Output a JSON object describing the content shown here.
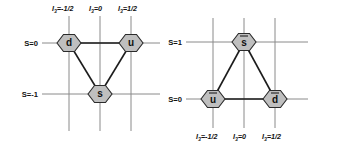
{
  "figure": {
    "title": "",
    "type": "weight-diagram",
    "panels": [
      {
        "id": "baryon-octet-left",
        "name": "quark-triplet",
        "vertical_axis": {
          "label_position": "top",
          "ticks": [
            {
              "text_prefix": "I",
              "text_sub": "3",
              "text_value": "=-1/2"
            },
            {
              "text_prefix": "I",
              "text_sub": "3",
              "text_value": "=0"
            },
            {
              "text_prefix": "I",
              "text_sub": "3",
              "text_value": "=1/2"
            }
          ]
        },
        "horizontal_axis": {
          "ticks": [
            {
              "label": "S=0"
            },
            {
              "label": "S=-1"
            }
          ]
        },
        "nodes": [
          {
            "name": "node-d",
            "label": "d",
            "bar": false,
            "i3": -0.5,
            "s": 0
          },
          {
            "name": "node-u",
            "label": "u",
            "bar": false,
            "i3": 0.5,
            "s": 0
          },
          {
            "name": "node-s",
            "label": "s",
            "bar": false,
            "i3": 0,
            "s": -1
          }
        ],
        "bonds": [
          [
            "node-d",
            "node-u"
          ],
          [
            "node-u",
            "node-s"
          ],
          [
            "node-s",
            "node-d"
          ]
        ]
      },
      {
        "id": "baryon-octet-right",
        "name": "antiquark-triplet",
        "vertical_axis": {
          "label_position": "bottom",
          "ticks": [
            {
              "text_prefix": "I",
              "text_sub": "3",
              "text_value": "=-1/2"
            },
            {
              "text_prefix": "I",
              "text_sub": "3",
              "text_value": "=0"
            },
            {
              "text_prefix": "I",
              "text_sub": "3",
              "text_value": "=1/2"
            }
          ]
        },
        "horizontal_axis": {
          "ticks": [
            {
              "label": "S=1"
            },
            {
              "label": "S=0"
            }
          ]
        },
        "nodes": [
          {
            "name": "node-sbar",
            "label": "s",
            "bar": true,
            "i3": 0,
            "s": 1
          },
          {
            "name": "node-ubar",
            "label": "u",
            "bar": true,
            "i3": -0.5,
            "s": 0
          },
          {
            "name": "node-dbar",
            "label": "d",
            "bar": true,
            "i3": 0.5,
            "s": 0
          }
        ],
        "bonds": [
          [
            "node-ubar",
            "node-dbar"
          ],
          [
            "node-sbar",
            "node-ubar"
          ],
          [
            "node-sbar",
            "node-dbar"
          ]
        ]
      }
    ],
    "colors": {
      "hex_fill": "#bfbfbf",
      "hex_stroke": "#2b2b2b",
      "grid": "#8a8a8a",
      "bond": "#1c1c1c",
      "background": "#ffffff"
    }
  }
}
